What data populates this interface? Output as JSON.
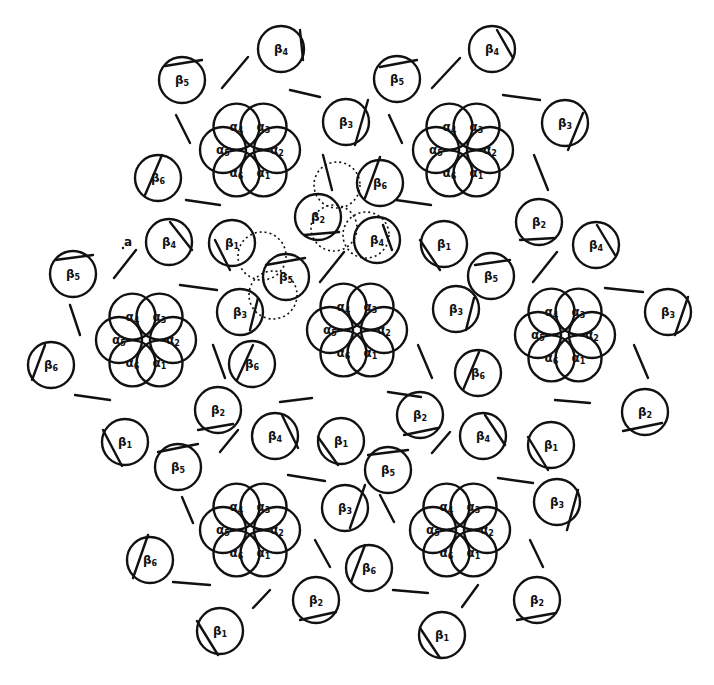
{
  "figure": {
    "colors": {
      "stroke": "#111111",
      "background": "#ffffff"
    },
    "alpha_radius": 23,
    "alpha_offset": 27,
    "beta_radius": 23,
    "rosettes": [
      {
        "cx": 250,
        "cy": 150
      },
      {
        "cx": 463,
        "cy": 150
      },
      {
        "cx": 146,
        "cy": 340
      },
      {
        "cx": 357,
        "cy": 330
      },
      {
        "cx": 565,
        "cy": 335
      },
      {
        "cx": 250,
        "cy": 530
      },
      {
        "cx": 460,
        "cy": 530
      }
    ],
    "alpha_labels": [
      {
        "label": "α1",
        "angle": 60
      },
      {
        "label": "α2",
        "angle": 0
      },
      {
        "label": "α3",
        "angle": -60
      },
      {
        "label": "α4",
        "angle": -120
      },
      {
        "label": "α5",
        "angle": 180
      },
      {
        "label": "α6",
        "angle": 120
      }
    ],
    "betas": [
      {
        "label": "β4",
        "cx": 281,
        "cy": 49,
        "chord": [
          300,
          30,
          303,
          60
        ]
      },
      {
        "label": "β5",
        "cx": 182,
        "cy": 80,
        "chord": [
          165,
          66,
          202,
          60
        ]
      },
      {
        "label": "β3",
        "cx": 346,
        "cy": 122,
        "chord": [
          368,
          100,
          355,
          145
        ]
      },
      {
        "label": "β6",
        "cx": 158,
        "cy": 178,
        "chord": [
          145,
          195,
          162,
          155
        ]
      },
      {
        "label": "β4",
        "cx": 492,
        "cy": 49,
        "chord": [
          497,
          30,
          513,
          58
        ]
      },
      {
        "label": "β5",
        "cx": 397,
        "cy": 79,
        "chord": [
          380,
          67,
          417,
          60
        ]
      },
      {
        "label": "β3",
        "cx": 565,
        "cy": 123,
        "chord": [
          583,
          113,
          568,
          150
        ]
      },
      {
        "label": "β6",
        "cx": 380,
        "cy": 183,
        "chord": [
          365,
          198,
          380,
          157
        ]
      },
      {
        "label": "β2",
        "cx": 318,
        "cy": 217,
        "chord": [
          304,
          235,
          339,
          232
        ]
      },
      {
        "label": "β4",
        "cx": 377,
        "cy": 240,
        "chord": [
          383,
          225,
          392,
          250
        ]
      },
      {
        "label": "β1",
        "cx": 232,
        "cy": 243,
        "chord": [
          215,
          240,
          230,
          270
        ]
      },
      {
        "label": "β5",
        "cx": 286,
        "cy": 277,
        "chord": [
          266,
          265,
          305,
          258
        ]
      },
      {
        "label": "β3",
        "cx": 240,
        "cy": 312,
        "chord": [
          258,
          298,
          250,
          330
        ]
      },
      {
        "label": "β4",
        "cx": 169,
        "cy": 242,
        "chord": [
          170,
          222,
          192,
          250
        ]
      },
      {
        "label": "β5",
        "cx": 73,
        "cy": 274,
        "chord": [
          55,
          260,
          93,
          255
        ]
      },
      {
        "label": "β6",
        "cx": 51,
        "cy": 365,
        "chord": [
          32,
          380,
          45,
          345
        ]
      },
      {
        "label": "β1",
        "cx": 444,
        "cy": 244,
        "chord": [
          420,
          240,
          440,
          270
        ]
      },
      {
        "label": "β2",
        "cx": 539,
        "cy": 222,
        "chord": [
          520,
          240,
          555,
          238
        ]
      },
      {
        "label": "β4",
        "cx": 596,
        "cy": 245,
        "chord": [
          597,
          225,
          615,
          255
        ]
      },
      {
        "label": "β5",
        "cx": 491,
        "cy": 276,
        "chord": [
          475,
          265,
          510,
          260
        ]
      },
      {
        "label": "β3",
        "cx": 456,
        "cy": 309,
        "chord": [
          474,
          298,
          466,
          330
        ]
      },
      {
        "label": "β3",
        "cx": 668,
        "cy": 312,
        "chord": [
          688,
          297,
          675,
          335
        ]
      },
      {
        "label": "β6",
        "cx": 478,
        "cy": 373,
        "chord": [
          463,
          390,
          479,
          352
        ]
      },
      {
        "label": "β6",
        "cx": 252,
        "cy": 364,
        "chord": [
          237,
          380,
          253,
          345
        ]
      },
      {
        "label": "β2",
        "cx": 218,
        "cy": 410,
        "chord": [
          198,
          430,
          233,
          424
        ]
      },
      {
        "label": "β2",
        "cx": 420,
        "cy": 415,
        "chord": [
          404,
          435,
          438,
          428
        ]
      },
      {
        "label": "β2",
        "cx": 645,
        "cy": 412,
        "chord": [
          623,
          431,
          662,
          423
        ]
      },
      {
        "label": "β1",
        "cx": 125,
        "cy": 442,
        "chord": [
          103,
          430,
          122,
          466
        ]
      },
      {
        "label": "β5",
        "cx": 178,
        "cy": 467,
        "chord": [
          158,
          452,
          198,
          444
        ]
      },
      {
        "label": "β4",
        "cx": 275,
        "cy": 436,
        "chord": [
          282,
          415,
          298,
          448
        ]
      },
      {
        "label": "β1",
        "cx": 341,
        "cy": 441,
        "chord": [
          318,
          437,
          338,
          465
        ]
      },
      {
        "label": "β5",
        "cx": 388,
        "cy": 470,
        "chord": [
          368,
          455,
          408,
          450
        ]
      },
      {
        "label": "β4",
        "cx": 483,
        "cy": 436,
        "chord": [
          485,
          415,
          505,
          445
        ]
      },
      {
        "label": "β1",
        "cx": 551,
        "cy": 445,
        "chord": [
          528,
          437,
          548,
          470
        ]
      },
      {
        "label": "β3",
        "cx": 345,
        "cy": 508,
        "chord": [
          365,
          485,
          350,
          528
        ]
      },
      {
        "label": "β3",
        "cx": 557,
        "cy": 502,
        "chord": [
          578,
          490,
          567,
          530
        ]
      },
      {
        "label": "β6",
        "cx": 150,
        "cy": 560,
        "chord": [
          133,
          578,
          148,
          535
        ]
      },
      {
        "label": "β6",
        "cx": 369,
        "cy": 568,
        "chord": [
          351,
          582,
          365,
          545
        ]
      },
      {
        "label": "β2",
        "cx": 316,
        "cy": 600,
        "chord": [
          300,
          620,
          336,
          612
        ]
      },
      {
        "label": "β2",
        "cx": 537,
        "cy": 600,
        "chord": [
          517,
          620,
          556,
          613
        ]
      },
      {
        "label": "β1",
        "cx": 220,
        "cy": 631,
        "chord": [
          197,
          621,
          218,
          655
        ]
      },
      {
        "label": "β1",
        "cx": 442,
        "cy": 635,
        "chord": [
          420,
          628,
          440,
          658
        ]
      }
    ],
    "bars": [
      [
        222,
        88,
        248,
        57
      ],
      [
        176,
        115,
        190,
        143
      ],
      [
        290,
        90,
        320,
        97
      ],
      [
        323,
        155,
        332,
        190
      ],
      [
        186,
        200,
        220,
        205
      ],
      [
        432,
        88,
        460,
        58
      ],
      [
        389,
        115,
        402,
        143
      ],
      [
        503,
        95,
        540,
        100
      ],
      [
        534,
        155,
        548,
        190
      ],
      [
        396,
        200,
        431,
        205
      ],
      [
        114,
        278,
        136,
        250
      ],
      [
        70,
        305,
        80,
        335
      ],
      [
        180,
        285,
        217,
        290
      ],
      [
        213,
        345,
        225,
        378
      ],
      [
        75,
        395,
        110,
        400
      ],
      [
        320,
        282,
        344,
        252
      ],
      [
        280,
        402,
        312,
        398
      ],
      [
        418,
        345,
        432,
        378
      ],
      [
        388,
        392,
        421,
        397
      ],
      [
        533,
        282,
        557,
        252
      ],
      [
        605,
        288,
        643,
        292
      ],
      [
        634,
        345,
        648,
        378
      ],
      [
        555,
        400,
        590,
        403
      ],
      [
        220,
        452,
        238,
        430
      ],
      [
        182,
        497,
        193,
        523
      ],
      [
        288,
        475,
        325,
        481
      ],
      [
        315,
        540,
        330,
        567
      ],
      [
        173,
        582,
        210,
        585
      ],
      [
        432,
        453,
        450,
        432
      ],
      [
        380,
        495,
        394,
        522
      ],
      [
        498,
        478,
        533,
        483
      ],
      [
        530,
        540,
        543,
        567
      ],
      [
        393,
        590,
        428,
        593
      ],
      [
        253,
        608,
        270,
        590
      ],
      [
        462,
        607,
        478,
        585
      ],
      [
        123,
        248,
        123,
        248
      ]
    ],
    "dotted_circles": [
      {
        "cx": 337,
        "cy": 185,
        "r": 23
      },
      {
        "cx": 334,
        "cy": 228,
        "r": 23
      },
      {
        "cx": 366,
        "cy": 235,
        "r": 23
      },
      {
        "cx": 262,
        "cy": 256,
        "r": 24
      },
      {
        "cx": 273,
        "cy": 295,
        "r": 24
      }
    ],
    "annotations": [
      {
        "text": "a",
        "x": 128,
        "y": 246
      }
    ]
  }
}
